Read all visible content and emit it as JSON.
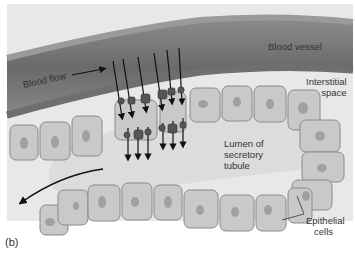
{
  "figure": {
    "caption": "(b)",
    "labels": {
      "blood_vessel": "Blood vessel",
      "blood_flow": "Blood flow",
      "interstitial_line1": "Interstitial",
      "interstitial_line2": "space",
      "lumen_line1": "Lumen of",
      "lumen_line2": "secretory",
      "lumen_line3": "tubule",
      "epithelial_line1": "Epithelial",
      "epithelial_line2": "cells"
    },
    "colors": {
      "background": "#e6e6e6",
      "vessel_wall": "#7a7a7a",
      "vessel_lumen": "#5e5e5e",
      "cell_fill": "#c8c8c8",
      "cell_border": "#8a8a8a",
      "nucleus": "#9a9a9a",
      "arrow": "#111111"
    },
    "arrows": {
      "blood_flow_direction": "right",
      "secretion_arrow_count_upper": 6,
      "secretion_arrow_count_lower": 6,
      "tubule_flow_direction": "left-down"
    }
  }
}
